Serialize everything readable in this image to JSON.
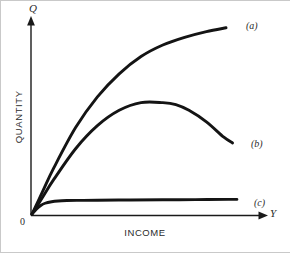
{
  "figure": {
    "background_color": "#ffffff",
    "border_color": "#c9c9c9",
    "curve_color": "#141414",
    "axis_color": "#1a1a1a"
  },
  "axes": {
    "y_symbol": "Q",
    "x_symbol": "Y",
    "origin_label": "0",
    "x_title": "INCOME",
    "y_title": "QUANTITY"
  },
  "labels": {
    "a": "(a)",
    "b": "(b)",
    "c": "(c)"
  },
  "chart_data": {
    "type": "line",
    "title": "",
    "subtitle": "",
    "xlabel": "INCOME",
    "ylabel": "QUANTITY",
    "x_axis_symbol": "Y",
    "y_axis_symbol": "Q",
    "origin_label": "0",
    "grid": false,
    "legend_position": "right-end-of-curve",
    "xlim": [
      0,
      100
    ],
    "ylim": [
      0,
      100
    ],
    "x_tick_labels": [],
    "y_tick_labels": [],
    "annotations": [
      "(a)",
      "(b)",
      "(c)"
    ],
    "series": [
      {
        "name": "(a)",
        "label": "(a)",
        "description": "normal good, concave increasing Engel curve",
        "x": [
          0,
          5,
          10,
          20,
          30,
          40,
          50,
          60,
          70,
          80,
          89
        ],
        "y": [
          0,
          12,
          24,
          45,
          61,
          73,
          82,
          88,
          92,
          95,
          97
        ]
      },
      {
        "name": "(b)",
        "label": "(b)",
        "description": "inferior good beyond a threshold, rises to a maximum then falls",
        "x": [
          0,
          5,
          10,
          20,
          30,
          40,
          50,
          60,
          66,
          72,
          80,
          88,
          92
        ],
        "y": [
          0,
          9,
          18,
          34,
          46,
          54,
          58,
          58,
          57,
          54,
          48,
          40,
          37
        ]
      },
      {
        "name": "(c)",
        "label": "(c)",
        "description": "satiated good, quantity saturates quickly at a low level",
        "x": [
          0,
          2,
          4,
          6,
          9,
          12,
          16,
          22,
          30,
          45,
          60,
          75,
          90,
          94
        ],
        "y": [
          0,
          2.5,
          4.4,
          5.6,
          6.4,
          6.8,
          7.0,
          7.1,
          7.2,
          7.3,
          7.4,
          7.5,
          7.6,
          7.6
        ]
      }
    ]
  }
}
